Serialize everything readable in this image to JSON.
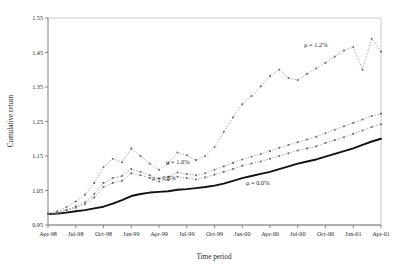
{
  "chart_data": {
    "type": "line",
    "title": "",
    "xlabel": "Time period",
    "ylabel": "Cumulative return",
    "ylim": [
      0.95,
      1.55
    ],
    "yticks": [
      "0.95",
      "1.05",
      "1.15",
      "1.25",
      "1.35",
      "1.45",
      "1.55"
    ],
    "ytick_values": [
      0.95,
      1.05,
      1.15,
      1.25,
      1.35,
      1.45,
      1.55
    ],
    "grid": false,
    "legend_position": "inline-annotations",
    "xtick_labels": [
      "Apr-98",
      "Jul-98",
      "Oct-98",
      "Jan-99",
      "Apr-99",
      "Jul-99",
      "Oct-99",
      "Jan-00",
      "Apr-00",
      "Jul-00",
      "Oct-00",
      "Jan-01",
      "Apr-01"
    ],
    "x": [
      "Apr-98",
      "May-98",
      "Jun-98",
      "Jul-98",
      "Aug-98",
      "Sep-98",
      "Oct-98",
      "Nov-98",
      "Dec-98",
      "Jan-99",
      "Feb-99",
      "Mar-99",
      "Apr-99",
      "May-99",
      "Jun-99",
      "Jul-99",
      "Aug-99",
      "Sep-99",
      "Oct-99",
      "Nov-99",
      "Dec-99",
      "Jan-00",
      "Feb-00",
      "Mar-00",
      "Apr-00",
      "May-00",
      "Jun-00",
      "Jul-00",
      "Aug-00",
      "Sep-00",
      "Oct-00",
      "Nov-00",
      "Dec-00",
      "Jan-01",
      "Feb-01",
      "Mar-01",
      "Apr-01"
    ],
    "series": [
      {
        "name": "mu = 0.0%",
        "label": "μ = 0.0%",
        "style": "solid-thick",
        "markers": false,
        "values": [
          0.982,
          0.983,
          0.986,
          0.99,
          0.993,
          0.998,
          1.003,
          1.012,
          1.022,
          1.034,
          1.04,
          1.044,
          1.046,
          1.048,
          1.052,
          1.054,
          1.057,
          1.06,
          1.064,
          1.07,
          1.078,
          1.086,
          1.092,
          1.098,
          1.104,
          1.112,
          1.12,
          1.128,
          1.134,
          1.14,
          1.148,
          1.156,
          1.164,
          1.172,
          1.182,
          1.192,
          1.2
        ]
      },
      {
        "name": "mu = 0.8%",
        "label": "μ = 0.8%",
        "style": "dotted",
        "markers": true,
        "values": [
          0.982,
          0.985,
          0.992,
          1.0,
          1.01,
          1.03,
          1.06,
          1.072,
          1.078,
          1.1,
          1.094,
          1.086,
          1.076,
          1.08,
          1.09,
          1.086,
          1.082,
          1.088,
          1.096,
          1.104,
          1.112,
          1.122,
          1.128,
          1.134,
          1.142,
          1.15,
          1.158,
          1.166,
          1.172,
          1.178,
          1.188,
          1.196,
          1.204,
          1.214,
          1.224,
          1.234,
          1.242
        ]
      },
      {
        "name": "mu = 1.0%",
        "label": "μ = 1.0%",
        "style": "dotted",
        "markers": true,
        "values": [
          0.982,
          0.986,
          0.994,
          1.004,
          1.016,
          1.04,
          1.072,
          1.086,
          1.092,
          1.112,
          1.104,
          1.094,
          1.084,
          1.09,
          1.102,
          1.098,
          1.094,
          1.1,
          1.11,
          1.12,
          1.13,
          1.14,
          1.148,
          1.156,
          1.164,
          1.174,
          1.182,
          1.19,
          1.198,
          1.206,
          1.216,
          1.226,
          1.236,
          1.246,
          1.256,
          1.266,
          1.272
        ]
      },
      {
        "name": "mu = 1.2%",
        "label": "μ = 1.2%",
        "style": "dotted",
        "markers": true,
        "values": [
          0.984,
          0.99,
          1.002,
          1.018,
          1.038,
          1.072,
          1.118,
          1.142,
          1.132,
          1.172,
          1.15,
          1.128,
          1.11,
          1.128,
          1.16,
          1.152,
          1.138,
          1.15,
          1.176,
          1.22,
          1.262,
          1.3,
          1.324,
          1.352,
          1.382,
          1.4,
          1.376,
          1.37,
          1.388,
          1.404,
          1.42,
          1.438,
          1.456,
          1.466,
          1.4,
          1.49,
          1.452
        ]
      }
    ],
    "annotations": [
      {
        "text": "μ = 1.2%",
        "x_px": 304,
        "y_px": 47
      },
      {
        "text": "μ = 1.0%",
        "x_px": 166,
        "y_px": 164
      },
      {
        "text": "μ = 0.8%",
        "x_px": 152,
        "y_px": 180
      },
      {
        "text": "μ = 0.0%",
        "x_px": 246,
        "y_px": 185
      }
    ],
    "colors": {
      "base_series": "#111111",
      "other_series": "#8d8d8d",
      "axis": "#7a7a7a",
      "frame": "#bdbdbd",
      "text": "#1f1f1f"
    }
  }
}
